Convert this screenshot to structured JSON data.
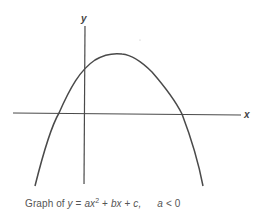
{
  "diagram": {
    "axis_labels": {
      "x": "x",
      "y": "y"
    },
    "colors": {
      "line": "#4a4a4a",
      "text": "#555555",
      "background": "#ffffff"
    },
    "caption": {
      "prefix": "Graph of ",
      "y": "y",
      "eq": " = ",
      "a": "ax",
      "sup": "2",
      "plus1": " + ",
      "bx": "bx",
      "plus2": " + ",
      "c": "c,",
      "cond_a": "a",
      "cond": " < 0"
    },
    "curve": {
      "type": "downward parabola",
      "vertex_px": [
        121,
        54
      ],
      "roots_px": [
        59,
        182
      ],
      "y_intercept_side": "positive"
    }
  }
}
